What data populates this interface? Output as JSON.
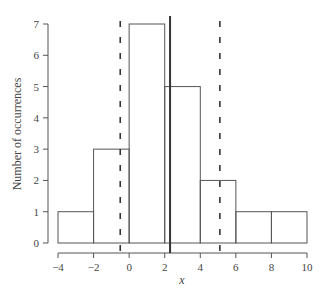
{
  "chart_data": {
    "type": "bar",
    "subtype": "histogram",
    "title": "",
    "xlabel": "x",
    "ylabel": "Number of occurrences",
    "bins": [
      {
        "from": -4,
        "to": -2,
        "count": 1
      },
      {
        "from": -2,
        "to": 0,
        "count": 3
      },
      {
        "from": 0,
        "to": 2,
        "count": 7
      },
      {
        "from": 2,
        "to": 4,
        "count": 5
      },
      {
        "from": 4,
        "to": 6,
        "count": 2
      },
      {
        "from": 6,
        "to": 8,
        "count": 1
      },
      {
        "from": 8,
        "to": 10,
        "count": 1
      }
    ],
    "categories": [
      "-4 to -2",
      "-2 to 0",
      "0 to 2",
      "2 to 4",
      "4 to 6",
      "6 to 8",
      "8 to 10"
    ],
    "values": [
      1,
      3,
      7,
      5,
      2,
      1,
      1
    ],
    "xlim": [
      -4,
      10
    ],
    "ylim": [
      0,
      7
    ],
    "xticks": [
      -4,
      -2,
      0,
      2,
      4,
      6,
      8,
      10
    ],
    "yticks": [
      0,
      1,
      2,
      3,
      4,
      5,
      6,
      7
    ],
    "xtick_labels": [
      "−4",
      "−2",
      "0",
      "2",
      "4",
      "6",
      "8",
      "10"
    ],
    "ytick_labels": [
      "0",
      "1",
      "2",
      "3",
      "4",
      "5",
      "6",
      "7"
    ],
    "annotations": [
      {
        "type": "vline",
        "style": "solid",
        "x": 2.3,
        "meaning": "mean"
      },
      {
        "type": "vline",
        "style": "dashed",
        "x": -0.5
      },
      {
        "type": "vline",
        "style": "dashed",
        "x": 5.1
      }
    ],
    "grid": false,
    "legend": null
  },
  "colors": {
    "stroke": "#555555",
    "mean_line": "#333333",
    "text": "#444444"
  }
}
